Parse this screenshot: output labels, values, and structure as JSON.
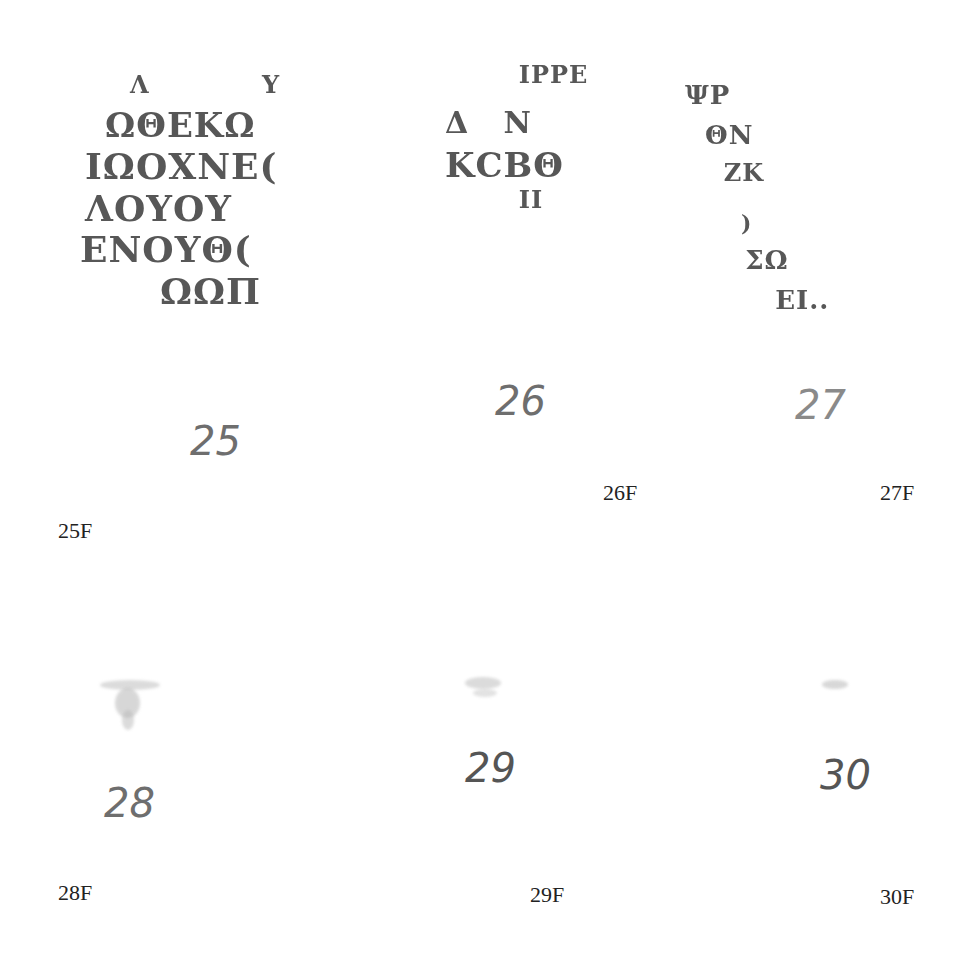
{
  "figures": [
    {
      "id": "25",
      "fragment_lines": [
        "Λ            Υ",
        "ΩΘΕΚΩ",
        "ΙΩΟΧΝΕ(",
        "ΛΟΥΟΥ",
        "ΕΝΟΥΘ(",
        "ΩΩΠ"
      ],
      "handwritten_number": "25",
      "label": "25F"
    },
    {
      "id": "26",
      "fragment_lines": [
        "  ΙΡΡΕ",
        "Δ   Ν",
        "ΚCΒΘ",
        "  ΙΙ"
      ],
      "handwritten_number": "26",
      "label": "26F"
    },
    {
      "id": "27",
      "fragment_lines": [
        "ΨΡ",
        " ΘΝ",
        "  ΖΚ",
        "   )",
        "   ΣΩ",
        "    ΕΙ.."
      ],
      "handwritten_number": "27",
      "label": "27F"
    },
    {
      "id": "28",
      "fragment_lines": [],
      "handwritten_number": "28",
      "label": "28F"
    },
    {
      "id": "29",
      "fragment_lines": [],
      "handwritten_number": "29",
      "label": "29F"
    },
    {
      "id": "30",
      "fragment_lines": [],
      "handwritten_number": "30",
      "label": "30F"
    }
  ]
}
